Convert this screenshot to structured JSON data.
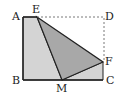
{
  "diagram": {
    "type": "geometry-folding",
    "points": {
      "A": [
        23,
        17
      ],
      "E": [
        37,
        17
      ],
      "D": [
        104,
        17
      ],
      "B": [
        23,
        80
      ],
      "M": [
        62,
        80
      ],
      "C": [
        103,
        80
      ],
      "F": [
        103,
        62
      ]
    },
    "labels": {
      "A": "A",
      "E": "E",
      "D": "D",
      "B": "B",
      "M": "M",
      "C": "C",
      "F": "F"
    },
    "colors": {
      "fill_light": "#d4d4d4",
      "fill_dark": "#a8a8a8",
      "stroke": "#222222",
      "dashed": "#555555"
    }
  }
}
